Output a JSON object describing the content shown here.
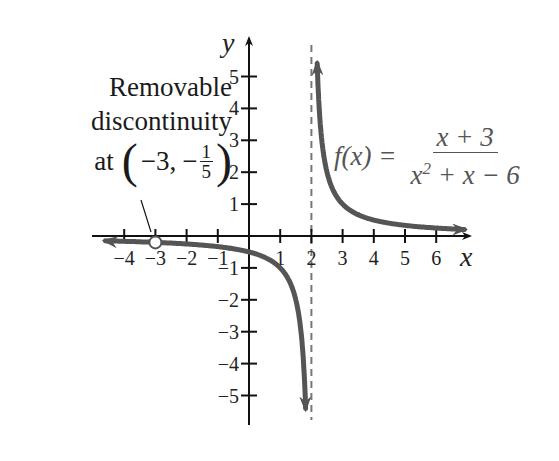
{
  "chart_data": {
    "type": "line",
    "title": "",
    "function": "f(x) = (x + 3) / (x^2 + x - 6)",
    "simplified": "1 / (x - 2), x != -3",
    "xlabel": "x",
    "ylabel": "y",
    "xlim": [
      -4.5,
      7
    ],
    "ylim": [
      -6,
      6
    ],
    "x_ticks": [
      -4,
      -3,
      -2,
      -1,
      1,
      2,
      3,
      4,
      5,
      6
    ],
    "y_ticks": [
      -5,
      -4,
      -3,
      -2,
      -1,
      1,
      2,
      3,
      4,
      5
    ],
    "grid": false,
    "vertical_asymptote": 2,
    "horizontal_asymptote": 0,
    "removable_discontinuity": {
      "x": -3,
      "y": -0.2
    },
    "series": [
      {
        "name": "left branch",
        "x": [
          -4.5,
          -4,
          -3,
          -2,
          -1,
          0,
          1,
          1.5,
          1.8,
          1.82
        ],
        "y": [
          -0.154,
          -0.167,
          -0.2,
          -0.25,
          -0.333,
          -0.5,
          -1,
          -2,
          -5,
          -5.6
        ]
      },
      {
        "name": "right branch",
        "x": [
          2.18,
          2.2,
          2.5,
          3,
          4,
          5,
          6,
          6.8
        ],
        "y": [
          5.6,
          5,
          2,
          1,
          0.5,
          0.333,
          0.25,
          0.208
        ]
      }
    ],
    "annotations": [
      "Removable discontinuity at (-3, -1/5)",
      "f(x) = (x + 3)/(x^2 + x - 6)"
    ]
  },
  "labels": {
    "annotation_line1": "Removable",
    "annotation_line2": "discontinuity",
    "annotation_at": "at",
    "annotation_point_x": "−3,",
    "annotation_point_num": "1",
    "annotation_point_den": "5",
    "formula_lhs": "f(x) =",
    "formula_num": "x + 3",
    "formula_den_a": "x",
    "formula_den_exp": "2",
    "formula_den_b": " + x − 6",
    "x_axis": "x",
    "y_axis": "y"
  },
  "colors": {
    "curve": "#555555",
    "axis": "#111111",
    "asymptote": "#777777",
    "text": "#222222"
  }
}
